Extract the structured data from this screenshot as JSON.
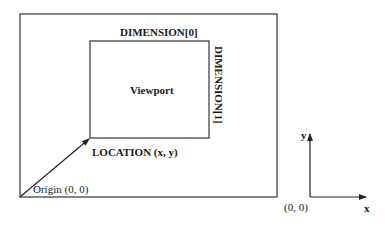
{
  "diagram": {
    "outer_box": {
      "label": "Origin (0, 0)"
    },
    "viewport": {
      "label": "Viewport",
      "width_label": "DIMENSION[0]",
      "height_label": "DIMENSION[1]",
      "location_label": "LOCATION (x, y)"
    },
    "axes": {
      "x_label": "x",
      "y_label": "y",
      "origin_label": "(0, 0)"
    },
    "colors": {
      "stroke": "#333333",
      "text": "#1a1a1a",
      "background": "#ffffff"
    }
  }
}
